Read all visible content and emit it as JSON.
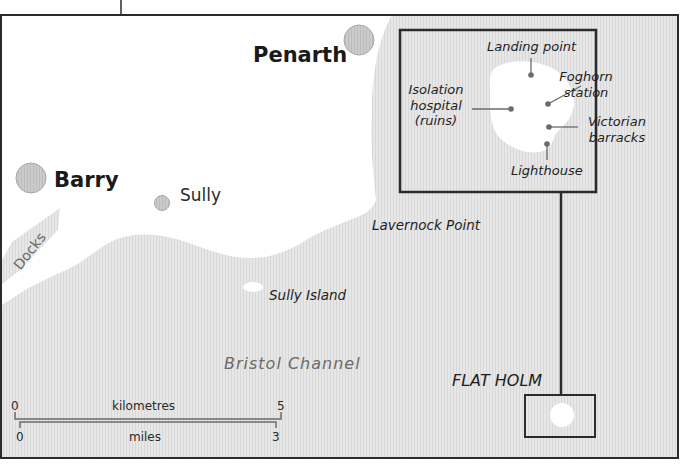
{
  "map": {
    "colors": {
      "land": "#ffffff",
      "sea": "#e6e6e6",
      "sea_stripe": "#d6d6d6",
      "town_fill": "#c8c8c8",
      "town_stroke": "#a8a8a8",
      "frame": "#2b2b2b",
      "point": "#6b6b6b"
    },
    "towns": [
      {
        "name": "Penarth",
        "size": "large"
      },
      {
        "name": "Barry",
        "size": "large"
      },
      {
        "name": "Sully",
        "size": "small"
      }
    ],
    "features": {
      "lavernock": "Lavernock Point",
      "sully_island": "Sully Island",
      "sea": "Bristol Channel",
      "docks": "Docks",
      "flat_holm": "FLAT HOLM"
    },
    "inset": {
      "labels": {
        "landing": "Landing point",
        "foghorn_1": "Foghorn",
        "foghorn_2": "station",
        "isolation_1": "Isolation",
        "isolation_2": "hospital",
        "isolation_3": "(ruins)",
        "victorian_1": "Victorian",
        "victorian_2": "barracks",
        "lighthouse": "Lighthouse"
      }
    },
    "scale": {
      "km_label": "kilometres",
      "km_start": "0",
      "km_end": "5",
      "mi_label": "miles",
      "mi_start": "0",
      "mi_end": "3"
    }
  }
}
